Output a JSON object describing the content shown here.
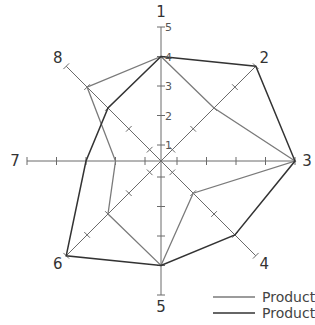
{
  "chart_data": {
    "type": "radar",
    "title": "",
    "axes": [
      "1",
      "2",
      "3",
      "4",
      "5",
      "6",
      "7",
      "8"
    ],
    "scale": {
      "min": 0,
      "max": 5,
      "tick_labels": [
        "1",
        "2",
        "3",
        "4",
        "5"
      ],
      "tick_label_axis": "1"
    },
    "series": [
      {
        "name": "Product 1",
        "color": "#7a7a7a",
        "values": [
          4,
          3,
          5,
          2,
          4,
          3,
          2,
          4
        ]
      },
      {
        "name": "Product 2",
        "color": "#333333",
        "values": [
          4,
          5,
          5,
          4,
          4,
          5,
          3,
          3
        ]
      }
    ],
    "legend_position": "bottom-right",
    "grid": false
  },
  "legend": {
    "items": [
      {
        "label": "Product 1",
        "color": "#7a7a7a"
      },
      {
        "label": "Product 2",
        "color": "#333333"
      }
    ]
  }
}
